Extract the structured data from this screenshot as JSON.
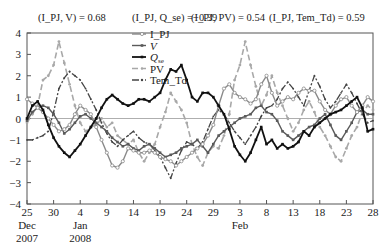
{
  "chart_data": {
    "type": "line",
    "title": "",
    "annotations": [
      "(I_PJ, V) = 0.68",
      "(I_PJ, Q_se) =−0.39",
      "(I_PJ, PV) = 0.54",
      "(I_PJ, Tem_Td) = 0.59"
    ],
    "xlabel": "",
    "ylabel": "",
    "ylim": [
      -4,
      4
    ],
    "yticks": [
      "4",
      "3",
      "2",
      "1",
      "0",
      "−1",
      "−2",
      "−3",
      "−4"
    ],
    "xticks": [
      "25",
      "30",
      "4",
      "9",
      "14",
      "19",
      "24",
      "29",
      "3",
      "8",
      "13",
      "18",
      "23",
      "28"
    ],
    "xtick_sublabels": {
      "25": [
        "Dec",
        "2007"
      ],
      "4": [
        "Jan",
        "2008"
      ],
      "3": [
        "Feb"
      ]
    },
    "x_range_days": [
      0,
      65
    ],
    "x_unit": "days since 25 Dec 2007",
    "legend": {
      "position": "upper-left-inside",
      "entries": [
        "I_PJ",
        "V",
        "Q_se",
        "PV",
        "Tem_Td"
      ]
    },
    "zero_line": true,
    "series": [
      {
        "name": "I_PJ",
        "style": "solid-grey-circle",
        "color": "#8a8a8a",
        "x": [
          0,
          1,
          2,
          3,
          4,
          5,
          6,
          7,
          8,
          9,
          10,
          11,
          12,
          13,
          14,
          15,
          16,
          17,
          18,
          19,
          20,
          21,
          22,
          23,
          24,
          25,
          26,
          27,
          28,
          29,
          30,
          31,
          32,
          33,
          34,
          35,
          36,
          37,
          38,
          39,
          40,
          41,
          42,
          43,
          44,
          45,
          46,
          47,
          48,
          49,
          50,
          51,
          52,
          53,
          54,
          55,
          56,
          57,
          58,
          59,
          60,
          61,
          62,
          63,
          64,
          65
        ],
        "values": [
          0.9,
          0.7,
          0.5,
          0.3,
          0.0,
          -0.3,
          -0.6,
          -0.5,
          -0.3,
          0.2,
          0.6,
          0.4,
          0.2,
          -0.4,
          -1.0,
          -1.6,
          -2.2,
          -2.3,
          -2.0,
          -1.4,
          -1.5,
          -1.6,
          -1.6,
          -1.5,
          -1.6,
          -1.8,
          -1.9,
          -2.0,
          -2.2,
          -2.0,
          -1.8,
          -1.6,
          -1.4,
          -1.2,
          -0.8,
          -0.3,
          0.6,
          1.4,
          1.6,
          1.2,
          1.0,
          0.9,
          0.7,
          0.9,
          1.6,
          2.0,
          1.2,
          0.6,
          0.8,
          1.0,
          0.9,
          1.2,
          1.4,
          1.3,
          1.3,
          0.8,
          0.4,
          0.2,
          0.6,
          0.9,
          1.0,
          0.6,
          0.3,
          0.6,
          1.0,
          0.8
        ]
      },
      {
        "name": "V",
        "style": "solid-darkgrey-square",
        "color": "#5a5a5a",
        "x": [
          0,
          1,
          2,
          3,
          4,
          5,
          6,
          7,
          8,
          9,
          10,
          11,
          12,
          13,
          14,
          15,
          16,
          17,
          18,
          19,
          20,
          21,
          22,
          23,
          24,
          25,
          26,
          27,
          28,
          29,
          30,
          31,
          32,
          33,
          34,
          35,
          36,
          37,
          38,
          39,
          40,
          41,
          42,
          43,
          44,
          45,
          46,
          47,
          48,
          49,
          50,
          51,
          52,
          53,
          54,
          55,
          56,
          57,
          58,
          59,
          60,
          61,
          62,
          63,
          64,
          65
        ],
        "values": [
          -0.1,
          0.3,
          0.5,
          0.6,
          0.5,
          0.2,
          -0.2,
          -0.7,
          -0.5,
          -0.2,
          0.1,
          0.2,
          0.0,
          -0.2,
          -0.4,
          -0.6,
          -0.9,
          -1.1,
          -1.3,
          -1.2,
          -1.4,
          -1.5,
          -1.3,
          -1.2,
          -1.4,
          -1.6,
          -1.8,
          -1.7,
          -1.6,
          -1.4,
          -1.3,
          -1.2,
          -1.0,
          -1.3,
          -1.6,
          -1.2,
          -0.8,
          -0.6,
          -0.4,
          -0.2,
          0.0,
          0.1,
          0.2,
          0.5,
          0.6,
          0.3,
          0.2,
          -0.1,
          -0.6,
          -0.8,
          -1.0,
          -0.8,
          -0.6,
          -0.4,
          -0.3,
          0.0,
          0.2,
          -0.3,
          -0.8,
          -1.0,
          -0.6,
          -0.2,
          0.3,
          0.4,
          0.2,
          0.2
        ]
      },
      {
        "name": "Q_se",
        "style": "solid-black-square",
        "color": "#111111",
        "x": [
          0,
          1,
          2,
          3,
          4,
          5,
          6,
          7,
          8,
          9,
          10,
          11,
          12,
          13,
          14,
          15,
          16,
          17,
          18,
          19,
          20,
          21,
          22,
          23,
          24,
          25,
          26,
          27,
          28,
          29,
          30,
          31,
          32,
          33,
          34,
          35,
          36,
          37,
          38,
          39,
          40,
          41,
          42,
          43,
          44,
          45,
          46,
          47,
          48,
          49,
          50,
          51,
          52,
          53,
          54,
          55,
          56,
          57,
          58,
          59,
          60,
          61,
          62,
          63,
          64,
          65
        ],
        "values": [
          0.0,
          0.6,
          0.8,
          0.4,
          -0.3,
          -0.9,
          -1.3,
          -1.6,
          -1.8,
          -1.5,
          -1.2,
          -0.8,
          -0.4,
          0.0,
          0.5,
          0.9,
          1.1,
          0.9,
          0.7,
          0.6,
          0.7,
          0.9,
          0.9,
          0.8,
          1.0,
          1.2,
          1.8,
          2.3,
          2.2,
          2.5,
          1.8,
          1.0,
          0.8,
          1.2,
          1.2,
          1.0,
          0.6,
          0.2,
          -0.5,
          -1.3,
          -1.7,
          -2.0,
          -1.6,
          -1.0,
          -0.4,
          -1.2,
          -1.0,
          -1.4,
          -1.2,
          -1.4,
          -1.3,
          -1.1,
          -0.6,
          -0.8,
          -0.4,
          -0.2,
          0.0,
          0.2,
          0.3,
          0.4,
          0.6,
          0.8,
          1.0,
          0.5,
          -0.6,
          -0.5
        ]
      },
      {
        "name": "PV",
        "style": "dashed-lightgrey-circle",
        "color": "#a8a8a8",
        "x": [
          0,
          1,
          2,
          3,
          4,
          5,
          6,
          7,
          8,
          9,
          10,
          11,
          12,
          13,
          14,
          15,
          16,
          17,
          18,
          19,
          20,
          21,
          22,
          23,
          24,
          25,
          26,
          27,
          28,
          29,
          30,
          31,
          32,
          33,
          34,
          35,
          36,
          37,
          38,
          39,
          40,
          41,
          42,
          43,
          44,
          45,
          46,
          47,
          48,
          49,
          50,
          51,
          52,
          53,
          54,
          55,
          56,
          57,
          58,
          59,
          60,
          61,
          62,
          63,
          64,
          65
        ],
        "values": [
          -0.2,
          0.2,
          0.6,
          1.8,
          2.0,
          2.5,
          3.6,
          2.6,
          1.6,
          0.6,
          -0.2,
          -0.6,
          -0.4,
          -0.3,
          0.0,
          -0.4,
          -0.2,
          -0.8,
          -1.0,
          -1.2,
          -1.0,
          -1.6,
          -2.0,
          -1.6,
          -1.2,
          -0.4,
          0.3,
          1.2,
          0.8,
          0.4,
          -0.2,
          -1.2,
          -1.8,
          -2.2,
          -1.6,
          -1.3,
          -1.4,
          -0.8,
          0.2,
          1.8,
          2.5,
          3.6,
          2.5,
          1.5,
          0.6,
          1.1,
          2.0,
          1.2,
          0.6,
          0.0,
          -0.6,
          -0.2,
          0.4,
          0.8,
          0.3,
          -0.4,
          -0.8,
          -1.3,
          -1.8,
          -2.0,
          -1.4,
          -0.8,
          -0.4,
          0.3,
          0.6,
          0.4
        ]
      },
      {
        "name": "Tem_Td",
        "style": "dashdot-darkgrey-dot",
        "color": "#444444",
        "x": [
          0,
          1,
          2,
          3,
          4,
          5,
          6,
          7,
          8,
          9,
          10,
          11,
          12,
          13,
          14,
          15,
          16,
          17,
          18,
          19,
          20,
          21,
          22,
          23,
          24,
          25,
          26,
          27,
          28,
          29,
          30,
          31,
          32,
          33,
          34,
          35,
          36,
          37,
          38,
          39,
          40,
          41,
          42,
          43,
          44,
          45,
          46,
          47,
          48,
          49,
          50,
          51,
          52,
          53,
          54,
          55,
          56,
          57,
          58,
          59,
          60,
          61,
          62,
          63,
          64,
          65
        ],
        "values": [
          -1.0,
          -1.0,
          -0.9,
          -0.8,
          -0.6,
          0.3,
          1.4,
          1.9,
          2.2,
          2.0,
          1.8,
          1.4,
          0.9,
          0.4,
          -0.2,
          -0.7,
          -1.1,
          -1.3,
          -1.0,
          -0.8,
          -0.6,
          -0.9,
          -1.1,
          -1.2,
          -1.5,
          -1.8,
          -2.3,
          -2.8,
          -2.1,
          -1.5,
          -1.1,
          -1.2,
          -1.4,
          -1.1,
          -0.5,
          0.1,
          0.4,
          0.2,
          -0.2,
          -0.6,
          -0.9,
          -1.2,
          -0.8,
          -0.4,
          0.1,
          0.5,
          0.6,
          0.9,
          1.4,
          1.7,
          1.4,
          1.0,
          0.6,
          1.3,
          2.0,
          1.5,
          0.9,
          0.5,
          0.8,
          1.2,
          1.6,
          1.2,
          0.7,
          0.2,
          -0.2,
          -0.1
        ]
      }
    ]
  }
}
